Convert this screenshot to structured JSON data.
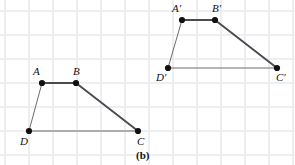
{
  "figure": {
    "caption": "(b)",
    "caption_pos": {
      "x": 136,
      "y": 150
    },
    "canvas": {
      "width": 295,
      "height": 165
    },
    "background_color": "#ffffff",
    "grid": {
      "visible": true,
      "color": "#eaeaee",
      "spacing": 24,
      "origin_x": 5,
      "origin_y": 11,
      "line_width": 1.6
    },
    "style": {
      "edge_color": "#6b6b70",
      "edge_color_dark": "#4a4a4f",
      "vertex_color": "#111111",
      "vertex_radius": 3.1,
      "edge_width_thin": 1.0,
      "edge_width_thick": 1.9,
      "label_color": "#111111"
    },
    "shapes": [
      {
        "name": "trapezoid-abcd",
        "id": "preimage",
        "vertices": [
          {
            "name": "A",
            "label": "A",
            "x": 42,
            "y": 83,
            "label_x": 33,
            "label_y": 66
          },
          {
            "name": "B",
            "label": "B",
            "x": 76,
            "y": 83,
            "label_x": 73,
            "label_y": 66
          },
          {
            "name": "C",
            "label": "C",
            "x": 138,
            "y": 131,
            "label_x": 137,
            "label_y": 136
          },
          {
            "name": "D",
            "label": "D",
            "x": 29,
            "y": 131,
            "label_x": 20,
            "label_y": 136
          }
        ],
        "edges": [
          {
            "name": "edge-AB",
            "from": "A",
            "to": "B",
            "weight": "thick"
          },
          {
            "name": "edge-BC",
            "from": "B",
            "to": "C",
            "weight": "thick"
          },
          {
            "name": "edge-CD",
            "from": "C",
            "to": "D",
            "weight": "thin"
          },
          {
            "name": "edge-DA",
            "from": "D",
            "to": "A",
            "weight": "thin"
          }
        ]
      },
      {
        "name": "trapezoid-abcd-prime",
        "id": "image",
        "vertices": [
          {
            "name": "A-prime",
            "label": "A′",
            "x": 182,
            "y": 20,
            "label_x": 172,
            "label_y": 3
          },
          {
            "name": "B-prime",
            "label": "B′",
            "x": 215,
            "y": 20,
            "label_x": 212,
            "label_y": 3
          },
          {
            "name": "C-prime",
            "label": "C′",
            "x": 277,
            "y": 68,
            "label_x": 276,
            "label_y": 72
          },
          {
            "name": "D-prime",
            "label": "D′",
            "x": 168,
            "y": 68,
            "label_x": 156,
            "label_y": 72
          }
        ],
        "edges": [
          {
            "name": "edge-ApBp",
            "from": "A-prime",
            "to": "B-prime",
            "weight": "thick"
          },
          {
            "name": "edge-BpCp",
            "from": "B-prime",
            "to": "C-prime",
            "weight": "thick"
          },
          {
            "name": "edge-CpDp",
            "from": "C-prime",
            "to": "D-prime",
            "weight": "thin"
          },
          {
            "name": "edge-DpAp",
            "from": "D-prime",
            "to": "A-prime",
            "weight": "thin"
          }
        ]
      }
    ]
  }
}
